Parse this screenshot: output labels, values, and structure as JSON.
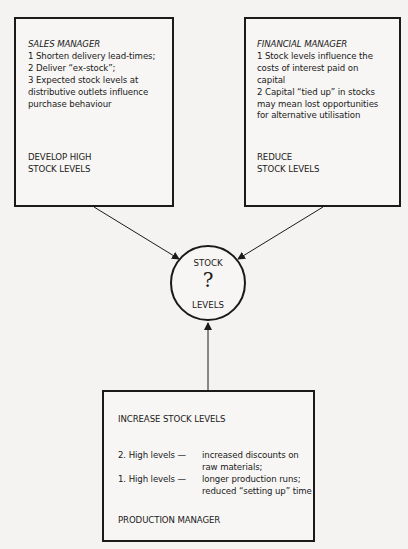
{
  "diagram": {
    "sales_manager": {
      "role": "SALES MANAGER",
      "points": [
        "1  Shorten delivery lead-times;",
        "2  Deliver “ex-stock”;",
        "3  Expected stock levels at",
        "distributive outlets influence",
        "purchase behaviour"
      ],
      "outcome_line1": "DEVELOP HIGH",
      "outcome_line2": "STOCK LEVELS"
    },
    "financial_manager": {
      "role": "FINANCIAL MANAGER",
      "points": [
        "1  Stock levels influence the",
        "costs of interest paid on",
        "capital",
        "2  Capital “tied up” in stocks",
        "may mean lost opportunities",
        "for alternative utilisation"
      ],
      "outcome_line1": "REDUCE",
      "outcome_line2": "STOCK LEVELS"
    },
    "center": {
      "top": "STOCK",
      "symbol": "?",
      "bottom": "LEVELS"
    },
    "production_manager": {
      "title": "INCREASE STOCK LEVELS",
      "items": [
        {
          "label": "2.  High levels —",
          "line1": "increased discounts on",
          "line2": "raw materials;"
        },
        {
          "label": "1.  High levels —",
          "line1": "longer production runs;",
          "line2": "reduced “setting up” time"
        }
      ],
      "role": "PRODUCTION MANAGER"
    }
  }
}
